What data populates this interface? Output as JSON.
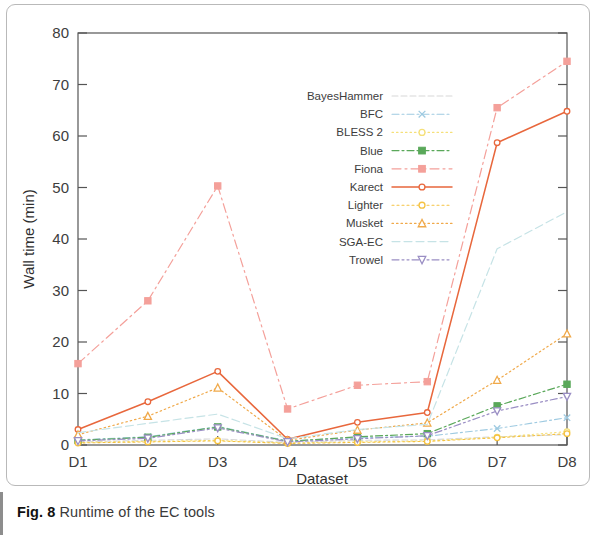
{
  "caption": {
    "label": "Fig. 8",
    "text": "Runtime of the EC tools"
  },
  "chart_data": {
    "type": "line",
    "title": "",
    "xlabel": "Dataset",
    "ylabel": "Wall time (min)",
    "categories": [
      "D1",
      "D2",
      "D3",
      "D4",
      "D5",
      "D6",
      "D7",
      "D8"
    ],
    "xtick_labels": [
      "D1",
      "D2",
      "D3",
      "D4",
      "D5",
      "D6",
      "D7",
      "D8"
    ],
    "ytick_labels": [
      "0",
      "10",
      "20",
      "30",
      "40",
      "50",
      "60",
      "70",
      "80"
    ],
    "yticks": [
      0,
      10,
      20,
      30,
      40,
      50,
      60,
      70,
      80
    ],
    "ylim": [
      0,
      80
    ],
    "grid": false,
    "legend_position": "center",
    "series": [
      {
        "name": "BayesHammer",
        "color": "#d8d8d8",
        "dash": "6 3",
        "marker": "none",
        "width": 1.1,
        "values": [
          0.6,
          0.9,
          1.2,
          0.5,
          0.9,
          1.0,
          1.6,
          2.0
        ]
      },
      {
        "name": "BFC",
        "color": "#9ecae1",
        "dash": "7 3 2 3",
        "marker": "x",
        "width": 1.1,
        "values": [
          1.0,
          1.6,
          3.6,
          0.8,
          1.4,
          1.7,
          3.2,
          5.3
        ]
      },
      {
        "name": "BLESS 2",
        "color": "#f5e07a",
        "dash": "1.5 3",
        "marker": "circle",
        "width": 1.1,
        "values": [
          0.5,
          0.7,
          0.9,
          0.4,
          0.6,
          0.8,
          1.5,
          2.6
        ]
      },
      {
        "name": "Blue",
        "color": "#5aa85a",
        "dash": "7 3 2 3",
        "marker": "square",
        "width": 1.2,
        "values": [
          0.9,
          1.5,
          3.5,
          0.7,
          1.6,
          2.2,
          7.6,
          11.8
        ]
      },
      {
        "name": "Fiona",
        "color": "#f4a09a",
        "dash": "9 4 2 4",
        "marker": "square",
        "width": 1.2,
        "values": [
          15.8,
          28.0,
          50.3,
          7.0,
          11.6,
          12.3,
          65.5,
          74.5
        ]
      },
      {
        "name": "Karect",
        "color": "#e8673c",
        "dash": "none",
        "marker": "circle",
        "width": 1.5,
        "values": [
          3.0,
          8.4,
          14.3,
          1.1,
          4.4,
          6.3,
          58.7,
          64.8
        ]
      },
      {
        "name": "Lighter",
        "color": "#f5c242",
        "dash": "2 3",
        "marker": "circle",
        "width": 1.1,
        "values": [
          0.4,
          0.6,
          0.8,
          0.3,
          0.5,
          0.7,
          1.4,
          2.2
        ]
      },
      {
        "name": "Musket",
        "color": "#f0a94a",
        "dash": "1.5 3",
        "marker": "triangle",
        "width": 1.2,
        "values": [
          2.0,
          5.6,
          11.1,
          0.9,
          2.9,
          4.3,
          12.6,
          21.6
        ]
      },
      {
        "name": "SGA-EC",
        "color": "#c6e3e6",
        "dash": "8 4",
        "marker": "none",
        "width": 1.2,
        "values": [
          2.4,
          4.2,
          6.0,
          1.2,
          3.0,
          4.0,
          38.1,
          45.3
        ]
      },
      {
        "name": "Trowel",
        "color": "#9a8ec4",
        "dash": "7 3 2 3 2 3",
        "marker": "triangle-down",
        "width": 1.2,
        "values": [
          0.8,
          1.3,
          3.3,
          0.6,
          1.2,
          1.8,
          6.6,
          9.4
        ]
      }
    ]
  }
}
